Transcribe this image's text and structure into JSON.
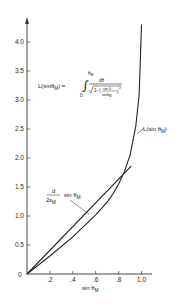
{
  "chart_data": {
    "type": "line",
    "title": "",
    "xlabel": "sin θ_M",
    "ylabel": "",
    "xlim": [
      0,
      1.05
    ],
    "ylim": [
      0,
      4.4
    ],
    "grid": false,
    "x_ticks": [
      ".2",
      ".4",
      ".6",
      ".8",
      "1.0"
    ],
    "y_ticks": [
      "0",
      "0.5",
      "1.0",
      "1.5",
      "2.0",
      "2.5",
      "3.0",
      "3.5",
      "4.0"
    ],
    "series": [
      {
        "name": "L(sin θ_M)",
        "x": [
          0,
          0.2,
          0.4,
          0.6,
          0.7,
          0.75,
          0.8,
          0.85,
          0.9,
          0.95,
          0.98,
          1.0
        ],
        "y": [
          0,
          0.31,
          0.64,
          1.02,
          1.24,
          1.38,
          1.55,
          1.76,
          2.05,
          2.55,
          3.1,
          4.3
        ]
      },
      {
        "name": "d/(2ε_M) sin θ_M",
        "x": [
          0,
          0.91
        ],
        "y": [
          0,
          1.86
        ]
      }
    ],
    "annotations": {
      "equation": {
        "lhs": "L(sinθ_M) =",
        "integral_upper": "θ_M",
        "integral_lower": "0",
        "numerator": "dθ",
        "denominator_prefix": "√1−(",
        "inner_numerator": "sin θ",
        "inner_denominator": "sinθ_M",
        "exponent": "2"
      },
      "curve_label": "L(sin θ_M)",
      "line_label_frac_num": "d",
      "line_label_frac_den": "2ε_M",
      "line_label_suffix": "sin θ_M"
    }
  }
}
